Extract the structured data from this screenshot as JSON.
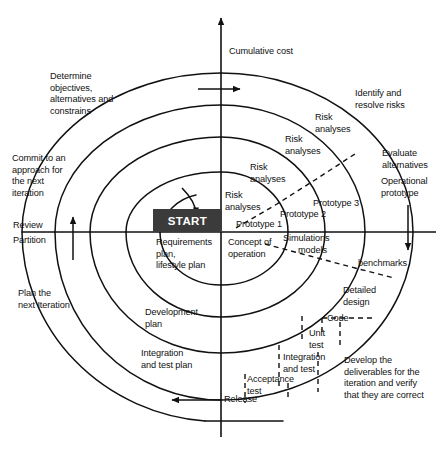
{
  "figure": {
    "type": "spiral-process-diagram",
    "background_color": "#ffffff",
    "line_color": "#111111",
    "text_color": "#111111",
    "start_box_fill": "#3b3b3b",
    "start_box_text_color": "#ffffff"
  },
  "axes": {
    "vertical_label": "Cumulative cost",
    "horizontal_left_upper_label": "Review",
    "horizontal_left_lower_label": "Partition",
    "vertical_axis_x": 221,
    "horizontal_axis_y": 232
  },
  "center": {
    "start_label": "START"
  },
  "quadrants": {
    "top_left": {
      "name": "Determine objectives",
      "lines": [
        "Determine",
        "objectives,",
        "alternatives and",
        "constrains"
      ]
    },
    "top_right": {
      "name": "Identify and resolve risks",
      "lines": [
        "Identify and",
        "resolve risks"
      ]
    },
    "bottom_right": {
      "name": "Develop and verify",
      "lines": [
        "Develop the",
        "deliverables for the",
        "iteration and verify",
        "that they are correct"
      ]
    },
    "bottom_left": {
      "name": "Plan the next iteration",
      "lines": [
        "Plan the",
        "next Iteration"
      ]
    }
  },
  "annotations": {
    "commit": [
      "Commit to an",
      "approach for",
      "the next",
      "iteration"
    ],
    "evaluate": [
      "Evaluate",
      "alternatives"
    ]
  },
  "risk_analyses": [
    {
      "id": "risk-1",
      "lines": [
        "Risk",
        "analyses"
      ]
    },
    {
      "id": "risk-2",
      "lines": [
        "Risk",
        "analyses"
      ]
    },
    {
      "id": "risk-3",
      "lines": [
        "Risk",
        "analyses"
      ]
    },
    {
      "id": "risk-4",
      "lines": [
        "Risk",
        "analyses"
      ]
    }
  ],
  "prototypes": [
    {
      "id": "prototype-1",
      "label": "Prototype 1"
    },
    {
      "id": "prototype-2",
      "label": "Prototype 2"
    },
    {
      "id": "prototype-3",
      "label": "Prototype 3"
    },
    {
      "id": "operational-prototype",
      "lines": [
        "Operational",
        "prototype"
      ]
    }
  ],
  "plans": [
    {
      "id": "requirements-plan",
      "lines": [
        "Requirements",
        "plan,",
        "lifestyle plan"
      ]
    },
    {
      "id": "development-plan",
      "lines": [
        "Development",
        "plan"
      ]
    },
    {
      "id": "integration-test-plan",
      "lines": [
        "Integration",
        "and test plan"
      ]
    }
  ],
  "products": [
    {
      "id": "concept-of-operation",
      "lines": [
        "Concept of",
        "operation"
      ]
    },
    {
      "id": "simulations-models",
      "lines": [
        "Simulations",
        "models"
      ]
    },
    {
      "id": "benchmarks",
      "label": "benchmarks"
    },
    {
      "id": "detailed-design",
      "lines": [
        "Detailed",
        "design"
      ]
    },
    {
      "id": "code",
      "label": "Code"
    },
    {
      "id": "unit-test",
      "lines": [
        "Unit",
        "test"
      ]
    },
    {
      "id": "integration-and-test",
      "lines": [
        "Integration",
        "and test"
      ]
    },
    {
      "id": "acceptance-test",
      "lines": [
        "Acceptance",
        "test"
      ]
    },
    {
      "id": "release",
      "label": "Release"
    }
  ],
  "arrows": [
    {
      "id": "cumulative-cost-arrow",
      "direction": "right"
    },
    {
      "id": "review-arrow",
      "direction": "up"
    },
    {
      "id": "partition-arrow",
      "direction": "down"
    },
    {
      "id": "release-arrow",
      "direction": "left"
    },
    {
      "id": "spiral-start-arrow",
      "direction": "counterclockwise"
    },
    {
      "id": "vertical-axis-arrow",
      "direction": "up"
    }
  ]
}
